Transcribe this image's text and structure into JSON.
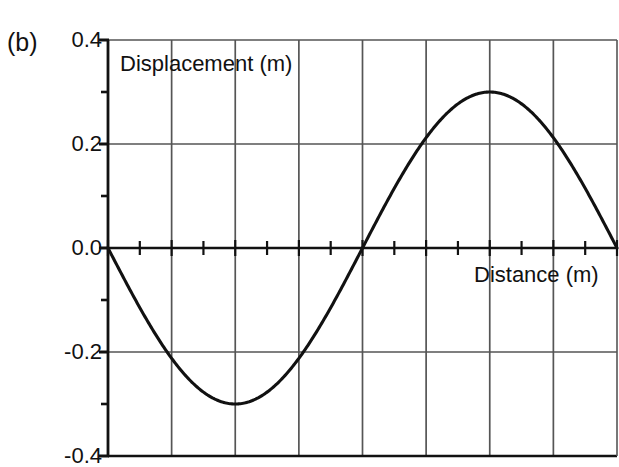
{
  "figure": {
    "panel_label": "(b)",
    "clipped_caption_above": "",
    "background": "#ffffff",
    "ink_color": "#111111",
    "grid_color": "#555555"
  },
  "chart_data": {
    "type": "line",
    "title": "",
    "subtitle": "",
    "xlabel": "Distance (m)",
    "ylabel": "Displacement (m)",
    "xlim": [
      0,
      8
    ],
    "ylim": [
      -0.4,
      0.4
    ],
    "grid": true,
    "legend": null,
    "y_tick_labels": [
      "0.4",
      "0.2",
      "0.0",
      "-0.2",
      "-0.4"
    ],
    "y_major_ticks": [
      0.4,
      0.2,
      0.0,
      -0.2,
      -0.4
    ],
    "y_minor_ticks": [
      0.3,
      0.1,
      -0.1,
      -0.3
    ],
    "x_tick_labels": [],
    "x_major_ticks": [
      0,
      1,
      2,
      3,
      4,
      5,
      6,
      7,
      8
    ],
    "x_minor_ticks": [
      0.5,
      1.5,
      2.5,
      3.5,
      4.5,
      5.5,
      6.5,
      7.5
    ],
    "series": [
      {
        "name": "displacement",
        "description": "sine wave, amplitude 0.3 m, wavelength 8 m, negative sine",
        "amplitude": 0.3,
        "wavelength": 8,
        "phase": "negative-sine",
        "x": [
          0,
          0.5,
          1,
          1.5,
          2,
          2.5,
          3,
          3.5,
          4,
          4.5,
          5,
          5.5,
          6,
          6.5,
          7,
          7.5,
          8
        ],
        "values": [
          0.0,
          -0.115,
          -0.212,
          -0.277,
          -0.3,
          -0.277,
          -0.212,
          -0.115,
          0.0,
          0.115,
          0.212,
          0.277,
          0.3,
          0.277,
          0.212,
          0.115,
          0.0
        ],
        "key_points": {
          "zero_start": 0,
          "minimum_x": 2,
          "minimum_y": -0.3,
          "zero_mid_x": 4,
          "maximum_x": 6,
          "maximum_y": 0.3,
          "zero_end_x": 8
        }
      }
    ]
  }
}
